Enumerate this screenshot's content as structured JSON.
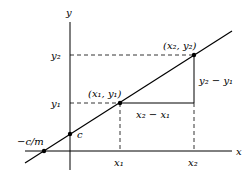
{
  "diagram": {
    "type": "line-slope-diagram",
    "axes": {
      "x_label": "x",
      "y_label": "y"
    },
    "points": [
      {
        "id": "p1",
        "label": "(x₁, y₁)"
      },
      {
        "id": "p2",
        "label": "(x₂, y₂)"
      },
      {
        "id": "c",
        "label": "c"
      },
      {
        "id": "xint",
        "label": "−c/m"
      }
    ],
    "ticks": {
      "x1": "x₁",
      "x2": "x₂",
      "y1": "y₁",
      "y2": "y₂"
    },
    "annotations": {
      "rise": "y₂ − y₁",
      "run": "x₂ − x₁"
    }
  }
}
